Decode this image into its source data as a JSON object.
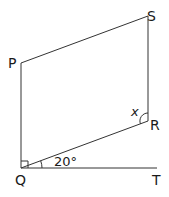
{
  "diagram": {
    "type": "geometry",
    "shape": "parallelogram PQRS with line QT",
    "points": {
      "P": {
        "label": "P",
        "x": 21,
        "y": 63
      },
      "S": {
        "label": "S",
        "x": 148,
        "y": 16
      },
      "R": {
        "label": "R",
        "x": 148,
        "y": 121
      },
      "Q": {
        "label": "Q",
        "x": 21,
        "y": 168
      },
      "T": {
        "label": "T",
        "x": 157,
        "y": 168
      }
    },
    "angles": {
      "RQT": {
        "label": "20°",
        "vertex": "Q"
      },
      "QRS": {
        "label": "x",
        "vertex": "R"
      },
      "PQT": {
        "label": "right-angle",
        "vertex": "Q"
      }
    },
    "line_color": "#333333"
  }
}
